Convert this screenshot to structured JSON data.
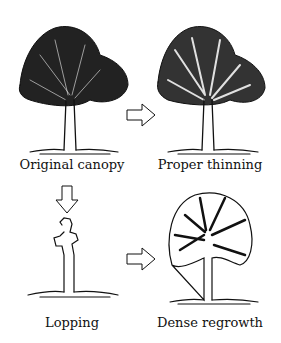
{
  "panels": [
    {
      "id": "original",
      "label": "Original canopy"
    },
    {
      "id": "thinning",
      "label": "Proper thinning"
    },
    {
      "id": "lopping",
      "label": "Lopping"
    },
    {
      "id": "regrowth",
      "label": "Dense regrowth"
    }
  ],
  "arrows": [
    {
      "from": "original",
      "to": "thinning",
      "direction": "right"
    },
    {
      "from": "original",
      "to": "lopping",
      "direction": "down"
    },
    {
      "from": "lopping",
      "to": "regrowth",
      "direction": "right"
    }
  ],
  "colors": {
    "ink": "#111111",
    "background": "#ffffff"
  }
}
